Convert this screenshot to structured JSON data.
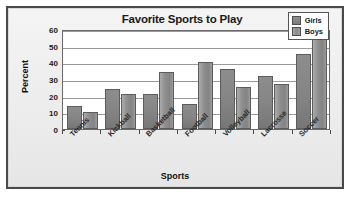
{
  "chart_data": {
    "type": "bar",
    "title": "Favorite Sports to Play",
    "xlabel": "Sports",
    "ylabel": "Percent",
    "categories": [
      "Tennis",
      "Kickball",
      "Basketball",
      "Football",
      "Volleyball",
      "Lacrosse",
      "Soccer"
    ],
    "series": [
      {
        "name": "Girls",
        "values": [
          14,
          24,
          21,
          15,
          36,
          32,
          45
        ],
        "color": "#858585"
      },
      {
        "name": "Boys",
        "values": [
          10,
          21,
          34,
          40,
          25,
          27,
          55
        ],
        "color": "#949494"
      }
    ],
    "ylim": [
      0,
      60
    ],
    "yticks": [
      0,
      10,
      20,
      30,
      40,
      50,
      60
    ],
    "ytick_labels": [
      "0",
      "10",
      "20",
      "30",
      "40",
      "50",
      "60"
    ],
    "grid": true,
    "grid_axis": "y",
    "legend_position": "top-right",
    "legend_entries": [
      "Girls",
      "Boys"
    ]
  },
  "legend": {
    "girls_label": "Girls",
    "boys_label": "Boys"
  },
  "colors": {
    "frame_border": "#4a4a4a",
    "figure_background": "#eeeeee",
    "plot_background": "#ffffff",
    "gridline": "#9a9a9a",
    "text": "#1a1a1a"
  }
}
